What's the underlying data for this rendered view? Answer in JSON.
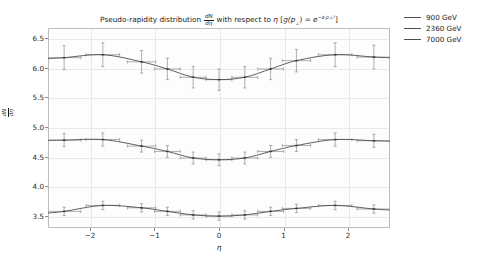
{
  "chart_data": {
    "type": "line",
    "title_parts": {
      "lead": "Pseudo-rapidity distribution",
      "frac_num": "dN",
      "frac_den": "dη",
      "mid": "with respect to",
      "eta": "η",
      "bracket_open": "[",
      "g_fn": "g(p",
      "g_sub": "⊥",
      "g_close": ") =",
      "exp_base": "e",
      "exp_sup": "−α′p⊥²",
      "bracket_close": "]"
    },
    "xlabel": "η",
    "ylabel": "dN/dη",
    "ylabel_parts": {
      "num": "dN",
      "den": "dη"
    },
    "xlim": [
      -2.65,
      2.65
    ],
    "ylim": [
      3.3,
      6.67
    ],
    "xticks": [
      -2,
      -1,
      0,
      1,
      2
    ],
    "xtick_labels": [
      "−2",
      "−1",
      "0",
      "1",
      "2"
    ],
    "yticks": [
      3.5,
      4.0,
      4.5,
      5.0,
      5.5,
      6.0,
      6.5
    ],
    "ytick_labels": [
      "3.5",
      "4.0",
      "4.5",
      "5.0",
      "5.5",
      "6.0",
      "6.5"
    ],
    "grid": true,
    "legend_position": "upper right outside",
    "line_color": "#4d4d4d",
    "errorbar_color": "#9a9a9a",
    "x": [
      -2.4,
      -1.8,
      -1.2,
      -0.8,
      -0.4,
      0.0,
      0.4,
      0.8,
      1.2,
      1.8,
      2.4
    ],
    "series": [
      {
        "name": "900 GeV",
        "values": [
          3.58,
          3.68,
          3.64,
          3.58,
          3.52,
          3.5,
          3.52,
          3.58,
          3.63,
          3.68,
          3.62
        ],
        "yerr": [
          0.07,
          0.07,
          0.07,
          0.07,
          0.07,
          0.07,
          0.07,
          0.07,
          0.07,
          0.07,
          0.07
        ],
        "xerr": [
          0.26,
          0.26,
          0.22,
          0.2,
          0.2,
          0.2,
          0.2,
          0.2,
          0.22,
          0.26,
          0.26
        ]
      },
      {
        "name": "2360 GeV",
        "values": [
          4.78,
          4.79,
          4.68,
          4.59,
          4.48,
          4.45,
          4.48,
          4.59,
          4.69,
          4.79,
          4.77
        ],
        "yerr": [
          0.11,
          0.11,
          0.1,
          0.1,
          0.1,
          0.1,
          0.1,
          0.1,
          0.1,
          0.11,
          0.11
        ],
        "xerr": [
          0.26,
          0.26,
          0.22,
          0.2,
          0.2,
          0.2,
          0.2,
          0.2,
          0.22,
          0.26,
          0.26
        ]
      },
      {
        "name": "7000 GeV",
        "values": [
          6.17,
          6.22,
          6.1,
          5.98,
          5.84,
          5.8,
          5.84,
          5.98,
          6.12,
          6.22,
          6.18
        ],
        "yerr": [
          0.2,
          0.2,
          0.19,
          0.18,
          0.18,
          0.18,
          0.18,
          0.18,
          0.19,
          0.2,
          0.2
        ],
        "xerr": [
          0.26,
          0.26,
          0.22,
          0.2,
          0.2,
          0.2,
          0.2,
          0.2,
          0.22,
          0.26,
          0.26
        ]
      }
    ]
  },
  "legend": {
    "items": [
      {
        "label": "900 GeV"
      },
      {
        "label": "2360 GeV"
      },
      {
        "label": "7000 GeV"
      }
    ]
  }
}
